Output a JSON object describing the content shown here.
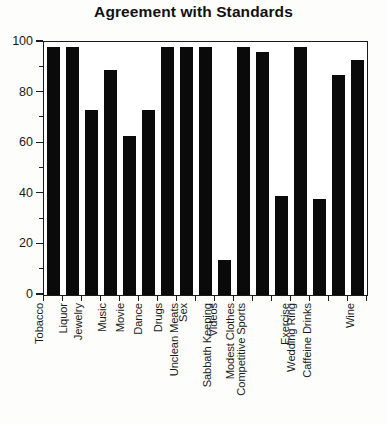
{
  "chart_data": {
    "type": "bar",
    "title": "Agreement with Standards",
    "xlabel": "",
    "ylabel": "",
    "ylim": [
      0,
      100
    ],
    "yticks": [
      0,
      20,
      40,
      60,
      80,
      100
    ],
    "ytick_labels": [
      "0",
      "20",
      "40",
      "60",
      "80",
      "100"
    ],
    "yminor_step": 10,
    "grid": false,
    "legend": false,
    "bar_color": "#0a0a0a",
    "orientation": "vertical",
    "xtick_rotation": -90,
    "categories": [
      "Tobacco",
      "Liquor",
      "Jewelry",
      "Music",
      "Movie",
      "Dance",
      "Drugs",
      "Sex",
      "Unclean Meats",
      "Videos",
      "Sabbath Keeping",
      "Modest Clothes",
      "Competitive Sports",
      "Exercise",
      "Wedding Ring",
      "Caffeine Drinks",
      "Wine"
    ],
    "values": [
      98,
      98,
      73,
      89,
      63,
      73,
      98,
      98,
      98,
      14,
      98,
      96,
      39,
      98,
      38,
      87,
      93
    ]
  }
}
